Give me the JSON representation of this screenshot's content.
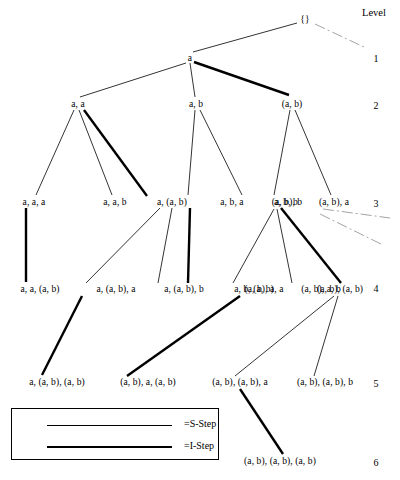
{
  "figure": {
    "level_column_title": "Level",
    "levels": [
      {
        "id": "L1",
        "label": "1",
        "x": 376,
        "y": 58
      },
      {
        "id": "L2",
        "label": "2",
        "x": 376,
        "y": 105
      },
      {
        "id": "L3",
        "label": "3",
        "x": 376,
        "y": 203
      },
      {
        "id": "L4",
        "label": "4",
        "x": 376,
        "y": 288
      },
      {
        "id": "L5",
        "label": "5",
        "x": 376,
        "y": 383
      },
      {
        "id": "L6",
        "label": "6",
        "x": 376,
        "y": 462
      }
    ],
    "level_title_pos": {
      "x": 374,
      "y": 12
    },
    "nodes": [
      {
        "id": "root",
        "label": "{}",
        "x": 305,
        "y": 19,
        "level": 0
      },
      {
        "id": "a",
        "label": "a",
        "x": 190,
        "y": 58,
        "level": 1
      },
      {
        "id": "aa",
        "label": "a, a",
        "x": 78,
        "y": 104,
        "level": 2
      },
      {
        "id": "ab",
        "label": "a, b",
        "x": 196,
        "y": 104,
        "level": 2
      },
      {
        "id": "AB",
        "label": "(a, b)",
        "x": 292,
        "y": 104,
        "level": 2
      },
      {
        "id": "aaa",
        "label": "a, a, a",
        "x": 34,
        "y": 202,
        "level": 3
      },
      {
        "id": "aab",
        "label": "a, a, b",
        "x": 115,
        "y": 202,
        "level": 3
      },
      {
        "id": "aAB",
        "label": "a, (a, b)",
        "x": 172,
        "y": 202,
        "level": 3
      },
      {
        "id": "aba",
        "label": "a, b, a",
        "x": 232,
        "y": 202,
        "level": 3
      },
      {
        "id": "abb",
        "label": "a, b, b",
        "x": 286,
        "y": 202,
        "level": 3
      },
      {
        "id": "ABa",
        "label": "(a, b), a",
        "x": 334,
        "y": 202,
        "level": 3
      },
      {
        "id": "ABb",
        "label": "(a, b), b",
        "x": 287,
        "y": 202,
        "level": 3
      },
      {
        "id": "aaAB",
        "label": "a, a, (a, b)",
        "x": 40,
        "y": 289,
        "level": 4
      },
      {
        "id": "aABa",
        "label": "a, (a, b), a",
        "x": 116,
        "y": 289,
        "level": 4
      },
      {
        "id": "aABb",
        "label": "a, (a, b), b",
        "x": 184,
        "y": 289,
        "level": 4
      },
      {
        "id": "abAB",
        "label": "a, b, (a, b)",
        "x": 254,
        "y": 289,
        "level": 4
      },
      {
        "id": "ABaa",
        "label": "(a, b), a, a",
        "x": 264,
        "y": 289,
        "level": 4
      },
      {
        "id": "ABab",
        "label": "(a, b), a, b",
        "x": 321,
        "y": 289,
        "level": 4
      },
      {
        "id": "ABAB",
        "label": "(a, b), (a, b)",
        "x": 340,
        "y": 289,
        "level": 4
      },
      {
        "id": "aABAB",
        "label": "a, (a, b), (a, b)",
        "x": 57,
        "y": 382,
        "level": 5
      },
      {
        "id": "ABaAB",
        "label": "(a, b), a, (a, b)",
        "x": 148,
        "y": 382,
        "level": 5
      },
      {
        "id": "ABABa",
        "label": "(a, b), (a, b), a",
        "x": 240,
        "y": 382,
        "level": 5
      },
      {
        "id": "ABABb",
        "label": "(a, b), (a, b), b",
        "x": 325,
        "y": 382,
        "level": 5
      },
      {
        "id": "ABABAB",
        "label": "(a, b), (a, b), (a, b)",
        "x": 280,
        "y": 461,
        "level": 6
      }
    ],
    "edges": [
      {
        "from": "root",
        "to": "a",
        "type": "S-Step",
        "x1": 297,
        "y1": 23,
        "x2": 193,
        "y2": 52
      },
      {
        "from": "a",
        "to": "aa",
        "type": "S-Step",
        "x1": 186,
        "y1": 63,
        "x2": 80,
        "y2": 97
      },
      {
        "from": "a",
        "to": "ab",
        "type": "S-Step",
        "x1": 190,
        "y1": 63,
        "x2": 195,
        "y2": 97
      },
      {
        "from": "a",
        "to": "AB",
        "type": "I-Step",
        "x1": 194,
        "y1": 62,
        "x2": 289,
        "y2": 95
      },
      {
        "from": "aa",
        "to": "aaa",
        "type": "S-Step",
        "x1": 74,
        "y1": 110,
        "x2": 36,
        "y2": 195
      },
      {
        "from": "aa",
        "to": "aab",
        "type": "S-Step",
        "x1": 79,
        "y1": 110,
        "x2": 112,
        "y2": 195
      },
      {
        "from": "aa",
        "to": "aAB",
        "type": "I-Step",
        "x1": 84,
        "y1": 110,
        "x2": 147,
        "y2": 196
      },
      {
        "from": "ab",
        "to": "aba",
        "type": "S-Step",
        "x1": 195,
        "y1": 110,
        "x2": 188,
        "y2": 195
      },
      {
        "from": "ab",
        "to": "abb",
        "type": "S-Step",
        "x1": 200,
        "y1": 110,
        "x2": 242,
        "y2": 195
      },
      {
        "from": "AB",
        "to": "ABa",
        "type": "S-Step",
        "x1": 290,
        "y1": 110,
        "x2": 274,
        "y2": 195
      },
      {
        "from": "AB",
        "to": "ABb",
        "type": "S-Step",
        "x1": 295,
        "y1": 110,
        "x2": 331,
        "y2": 195
      },
      {
        "from": "aaa",
        "to": "aaAB",
        "type": "I-Step",
        "x1": 26,
        "y1": 208,
        "x2": 26,
        "y2": 282
      },
      {
        "from": "aAB",
        "to": "aABa",
        "type": "S-Step",
        "x1": 160,
        "y1": 208,
        "x2": 86,
        "y2": 283
      },
      {
        "from": "aAB",
        "to": "aABb",
        "type": "S-Step",
        "x1": 172,
        "y1": 208,
        "x2": 158,
        "y2": 283
      },
      {
        "from": "aba",
        "to": "abAB",
        "type": "I-Step",
        "x1": 190,
        "y1": 208,
        "x2": 188,
        "y2": 283
      },
      {
        "from": "ABa",
        "to": "ABaa",
        "type": "S-Step",
        "x1": 274,
        "y1": 209,
        "x2": 233,
        "y2": 283
      },
      {
        "from": "ABa",
        "to": "ABab",
        "type": "S-Step",
        "x1": 277,
        "y1": 209,
        "x2": 292,
        "y2": 283
      },
      {
        "from": "ABa",
        "to": "ABAB",
        "type": "I-Step",
        "x1": 281,
        "y1": 208,
        "x2": 341,
        "y2": 283
      },
      {
        "from": "aABa",
        "to": "aABAB",
        "type": "I-Step",
        "x1": 82,
        "y1": 296,
        "x2": 42,
        "y2": 375
      },
      {
        "from": "ABaa",
        "to": "ABaAB",
        "type": "I-Step",
        "x1": 240,
        "y1": 296,
        "x2": 127,
        "y2": 376
      },
      {
        "from": "ABAB",
        "to": "ABABa",
        "type": "S-Step",
        "x1": 334,
        "y1": 296,
        "x2": 235,
        "y2": 376
      },
      {
        "from": "ABAB",
        "to": "ABABb",
        "type": "S-Step",
        "x1": 338,
        "y1": 296,
        "x2": 314,
        "y2": 376
      },
      {
        "from": "ABABa",
        "to": "ABABAB",
        "type": "I-Step",
        "x1": 240,
        "y1": 389,
        "x2": 283,
        "y2": 454
      }
    ],
    "truncation_marks": [
      {
        "id": "root-trunc",
        "x1": 315,
        "y1": 24,
        "x2": 364,
        "y2": 47
      },
      {
        "id": "abb-trunc-1",
        "x1": 323,
        "y1": 209,
        "x2": 390,
        "y2": 218
      },
      {
        "id": "abb-trunc-2",
        "x1": 320,
        "y1": 214,
        "x2": 383,
        "y2": 245
      }
    ],
    "legend": {
      "items": [
        {
          "id": "s-step",
          "line": "thin",
          "text": "=S-Step"
        },
        {
          "id": "i-step",
          "line": "thick",
          "text": "=I-Step"
        }
      ]
    }
  }
}
